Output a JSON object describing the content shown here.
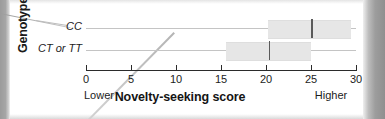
{
  "chart_data": {
    "type": "bar",
    "orientation": "horizontal",
    "title": "",
    "xlabel": "Novelty-seeking score",
    "ylabel": "Genotype",
    "xlim": [
      0,
      30
    ],
    "xticks": [
      0,
      5,
      10,
      15,
      20,
      25,
      30
    ],
    "xticklabels": [
      "0",
      "5",
      "10",
      "15",
      "20",
      "25",
      "30"
    ],
    "grid": true,
    "legend": null,
    "axis_anchor_low": "Lower",
    "axis_anchor_high": "Higher",
    "categories": [
      "CC",
      "CT or TT"
    ],
    "series": [
      {
        "name": "Novelty-seeking score range",
        "items": [
          {
            "category": "CC",
            "low": 20.2,
            "high": 29.5,
            "median": 25.0
          },
          {
            "category": "CT or TT",
            "low": 15.5,
            "high": 25.0,
            "median": 20.3
          }
        ]
      }
    ]
  },
  "axes": {
    "y_title": "Genotype",
    "x_title": "Novelty-seeking score",
    "anchors": {
      "low": "Lower",
      "high": "Higher"
    },
    "ticks": [
      {
        "label": "0",
        "value": 0
      },
      {
        "label": "5",
        "value": 5
      },
      {
        "label": "10",
        "value": 10
      },
      {
        "label": "15",
        "value": 15
      },
      {
        "label": "20",
        "value": 20
      },
      {
        "label": "25",
        "value": 25
      },
      {
        "label": "30",
        "value": 30
      }
    ]
  },
  "categories": [
    {
      "label": "CC",
      "low": 20.2,
      "high": 29.5,
      "median": 25.0
    },
    {
      "label": "CT or TT",
      "low": 15.5,
      "high": 25.0,
      "median": 20.3
    }
  ],
  "colors": {
    "bar_fill": "#e6e6e6",
    "median_line": "#5a5a5a",
    "axis": "#2b2b2b",
    "gridline": "#c4c4c4",
    "text": "#1c1c1c"
  }
}
